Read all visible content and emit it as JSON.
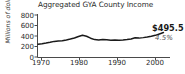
{
  "chart_data": {
    "type": "line",
    "title": "Aggregated GYA County Income",
    "xlabel": "",
    "ylabel": "Millions of dollars",
    "xlim": [
      1969,
      2001
    ],
    "ylim": [
      0,
      870
    ],
    "grid": false,
    "legend": "none",
    "yticks": [
      0,
      200,
      400,
      600,
      800
    ],
    "ytick_labels": [
      "0",
      "200",
      "400",
      "600",
      "800"
    ],
    "xticks": [
      1970,
      1980,
      1990,
      2000
    ],
    "xtick_labels": [
      "1970",
      "1980",
      "1990",
      "2000"
    ],
    "series": [
      {
        "name": "Aggregated GYA County Income",
        "color": "#1a1a1a",
        "x": [
          1969,
          1970,
          1971,
          1972,
          1973,
          1974,
          1975,
          1976,
          1977,
          1978,
          1979,
          1980,
          1981,
          1982,
          1983,
          1984,
          1985,
          1986,
          1987,
          1988,
          1989,
          1990,
          1991,
          1992,
          1993,
          1994,
          1995,
          1996,
          1997,
          1998,
          1999,
          2000
        ],
        "values": [
          258,
          268,
          281,
          297,
          316,
          324,
          330,
          345,
          363,
          385,
          414,
          441,
          420,
          381,
          352,
          345,
          356,
          349,
          341,
          345,
          338,
          344,
          352,
          366,
          388,
          382,
          392,
          404,
          419,
          438,
          466,
          495.5
        ]
      }
    ],
    "annotations": [
      {
        "name": "endpoint-value",
        "text": "$495.5",
        "x": 2000,
        "y": 495.5
      },
      {
        "name": "endpoint-change",
        "text": "4.5%"
      }
    ]
  }
}
